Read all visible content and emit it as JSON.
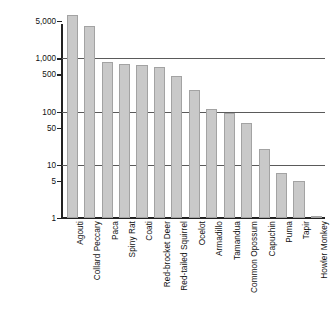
{
  "chart_data": {
    "type": "bar",
    "title": "",
    "subtitle": "",
    "xlabel": "",
    "ylabel": "Number of mammals",
    "yscale": "log",
    "ylim": [
      1,
      8000
    ],
    "grid": "horizontal gridlines at 10, 100, 1000",
    "legend": "none",
    "y_ticks": [
      {
        "value": 1,
        "label": "1",
        "gridline": false
      },
      {
        "value": 5,
        "label": "5",
        "gridline": false
      },
      {
        "value": 10,
        "label": "10",
        "gridline": true
      },
      {
        "value": 50,
        "label": "50",
        "gridline": false
      },
      {
        "value": 100,
        "label": "100",
        "gridline": true
      },
      {
        "value": 500,
        "label": "500",
        "gridline": false
      },
      {
        "value": 1000,
        "label": "1,000",
        "gridline": true
      },
      {
        "value": 5000,
        "label": "5,000",
        "gridline": false
      }
    ],
    "categories": [
      "Agouti",
      "Collard Peccary",
      "Paca",
      "Spiny Rat",
      "Coati",
      "Red-brocket Deer",
      "Red-tailed Squirrel",
      "Ocelot",
      "Armadillo",
      "Tamandua",
      "Common Opossum",
      "Capuchin",
      "Puma",
      "Tapir",
      "Howler Monkey"
    ],
    "values": [
      6500,
      4000,
      850,
      790,
      760,
      690,
      470,
      250,
      110,
      93,
      60,
      20,
      7,
      5,
      1.1
    ]
  },
  "colors": {
    "bar_fill": "#c9c9c9",
    "bar_edge": "#a3a3a3",
    "axis": "#222222",
    "gridline": "#5a5a5a",
    "text": "#111111",
    "background": "#ffffff"
  }
}
